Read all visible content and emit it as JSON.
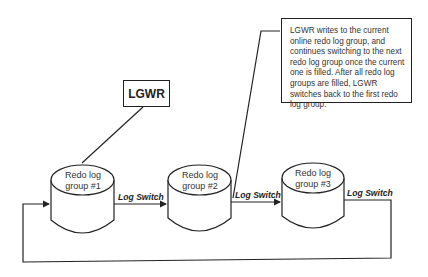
{
  "diagram": {
    "process": {
      "label": "LGWR"
    },
    "note": {
      "text": "LGWR writes to the current online redo log group, and continues switching to the next redo log group once the current one is filled. After all redo log groups are filled, LGWR switches back to the first redo log group."
    },
    "groups": [
      {
        "label": "Redo log group #1"
      },
      {
        "label": "Redo log group #2"
      },
      {
        "label": "Redo log group #3"
      }
    ],
    "switches": [
      {
        "label": "Log Switch"
      },
      {
        "label": "Log Switch"
      },
      {
        "label": "Log Switch"
      }
    ],
    "colors": {
      "line": "#222222",
      "background": "#ffffff"
    }
  }
}
